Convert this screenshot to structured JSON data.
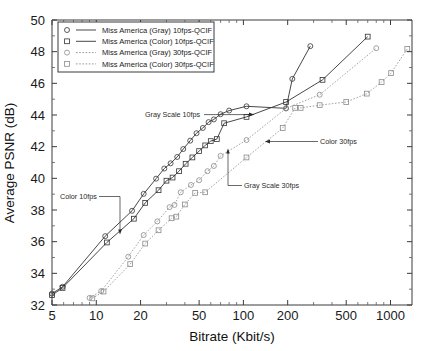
{
  "chart_data": {
    "type": "line",
    "title": "",
    "xlabel": "Bitrate (Kbit/s)",
    "ylabel": "Average PSNR (dB)",
    "xscale": "log",
    "yscale": "linear",
    "xlim": [
      5,
      1400
    ],
    "ylim": [
      32,
      50
    ],
    "xticks": [
      5,
      10,
      20,
      50,
      100,
      200,
      500,
      1000
    ],
    "xticklabels": [
      "5",
      "10",
      "20",
      "50",
      "100",
      "200",
      "500",
      "1000"
    ],
    "yticks": [
      32,
      34,
      36,
      38,
      40,
      42,
      44,
      46,
      48,
      50
    ],
    "yticklabels": [
      "32",
      "34",
      "36",
      "38",
      "40",
      "42",
      "44",
      "46",
      "48",
      "50"
    ],
    "grid": false,
    "legend_position": "upper-left",
    "series": [
      {
        "name": "Miss America (Gray) 10fps-QCIF",
        "marker": "circle",
        "linestyle": "solid",
        "color": "#333333",
        "points": [
          [
            5.0,
            32.72
          ],
          [
            5.9,
            33.15
          ],
          [
            11.5,
            36.35
          ],
          [
            17.5,
            37.95
          ],
          [
            21.0,
            39.02
          ],
          [
            25.5,
            39.98
          ],
          [
            29.0,
            40.62
          ],
          [
            32.0,
            40.95
          ],
          [
            35.5,
            41.35
          ],
          [
            39.0,
            41.85
          ],
          [
            43.5,
            42.38
          ],
          [
            48.0,
            42.85
          ],
          [
            53.0,
            43.18
          ],
          [
            58.0,
            43.55
          ],
          [
            63.0,
            43.72
          ],
          [
            70.0,
            44.05
          ],
          [
            80.0,
            44.28
          ],
          [
            105.0,
            44.55
          ],
          [
            195.0,
            44.42
          ],
          [
            215.0,
            46.28
          ],
          [
            285.0,
            48.35
          ]
        ]
      },
      {
        "name": "Miss America (Color) 10fps-QCIF",
        "marker": "square",
        "linestyle": "solid",
        "color": "#333333",
        "points": [
          [
            5.0,
            32.62
          ],
          [
            5.9,
            33.08
          ],
          [
            11.8,
            35.95
          ],
          [
            18.0,
            37.45
          ],
          [
            21.5,
            38.45
          ],
          [
            26.5,
            39.25
          ],
          [
            30.0,
            39.85
          ],
          [
            33.0,
            40.05
          ],
          [
            36.5,
            40.45
          ],
          [
            40.5,
            40.92
          ],
          [
            45.0,
            41.32
          ],
          [
            50.0,
            41.72
          ],
          [
            55.0,
            42.08
          ],
          [
            60.0,
            42.35
          ],
          [
            66.0,
            42.48
          ],
          [
            74.0,
            43.48
          ],
          [
            105.0,
            43.88
          ],
          [
            195.0,
            44.82
          ],
          [
            345.0,
            46.22
          ],
          [
            700.0,
            48.95
          ]
        ]
      },
      {
        "name": "Miss America (Gray) 30fps-QCIF",
        "marker": "circle",
        "linestyle": "dotted",
        "color": "#8a8a8a",
        "points": [
          [
            9.0,
            32.45
          ],
          [
            10.8,
            32.88
          ],
          [
            16.5,
            35.05
          ],
          [
            21.0,
            36.42
          ],
          [
            26.0,
            37.28
          ],
          [
            31.5,
            38.18
          ],
          [
            34.0,
            38.32
          ],
          [
            37.5,
            39.12
          ],
          [
            44.0,
            39.58
          ],
          [
            50.0,
            39.88
          ],
          [
            57.0,
            40.45
          ],
          [
            63.0,
            40.78
          ],
          [
            70.0,
            41.42
          ],
          [
            105.0,
            42.42
          ],
          [
            195.0,
            44.42
          ],
          [
            330.0,
            45.28
          ],
          [
            800.0,
            48.22
          ]
        ]
      },
      {
        "name": "Miss America (Color) 30fps-QCIF",
        "marker": "square",
        "linestyle": "dotted",
        "color": "#8a8a8a",
        "points": [
          [
            9.4,
            32.42
          ],
          [
            11.2,
            32.85
          ],
          [
            17.0,
            34.58
          ],
          [
            21.5,
            35.88
          ],
          [
            26.5,
            36.72
          ],
          [
            32.5,
            37.48
          ],
          [
            35.0,
            37.58
          ],
          [
            40.0,
            38.35
          ],
          [
            47.0,
            39.08
          ],
          [
            55.0,
            39.12
          ],
          [
            105.0,
            41.32
          ],
          [
            185.0,
            43.18
          ],
          [
            225.0,
            44.45
          ],
          [
            245.0,
            44.45
          ],
          [
            330.0,
            44.62
          ],
          [
            500.0,
            44.82
          ],
          [
            690.0,
            45.35
          ],
          [
            870.0,
            46.08
          ],
          [
            1010.0,
            46.65
          ],
          [
            1300.0,
            48.18
          ]
        ]
      }
    ],
    "annotations": [
      {
        "id": "gray-scale-10fps",
        "text": "Gray Scale 10fps",
        "text_x": 145,
        "text_y": 117,
        "anchor": "start",
        "leader": "M 204,114.6 L 254,114.6",
        "arrow": "M 254,114.6 L 249,112.6 L 249,116.6 Z"
      },
      {
        "id": "color-10fps",
        "text": "Color 10fps",
        "text_x": 60,
        "text_y": 199,
        "anchor": "start",
        "leader": "M 99,196.5 L 120,196.5 L 120,232 L 121.5,229",
        "arrow": "M 120,234.5 L 118.2,229.5 L 121.8,229.5 Z"
      },
      {
        "id": "color-30fps",
        "text": "Color 30fps",
        "text_x": 320,
        "text_y": 144,
        "anchor": "start",
        "leader": "M 318,141.5 L 268,141.5",
        "arrow": "M 265,141.5 L 270,139.5 L 270,143.5 Z"
      },
      {
        "id": "gray-scale-30fps",
        "text": "Gray Scale 30fps",
        "text_x": 244,
        "text_y": 188,
        "anchor": "start",
        "leader": "M 242,185.5 L 228,185.5 L 228,154 L 228,152",
        "arrow": "M 228,148.5 L 226.2,153.5 L 229.8,153.5 Z"
      }
    ],
    "legend_entries": [
      {
        "label": "Miss America (Gray) 10fps-QCIF",
        "marker": "circle",
        "linestyle": "solid",
        "color": "#333333"
      },
      {
        "label": "Miss America (Color) 10fps-QCIF",
        "marker": "square",
        "linestyle": "solid",
        "color": "#333333"
      },
      {
        "label": "Miss America (Gray) 30fps-QCIF",
        "marker": "circle",
        "linestyle": "dotted",
        "color": "#8a8a8a"
      },
      {
        "label": "Miss America (Color) 30fps-QCIF",
        "marker": "square",
        "linestyle": "dotted",
        "color": "#8a8a8a"
      }
    ]
  },
  "plot_geometry": {
    "left": 52,
    "right": 412,
    "top": 20,
    "bottom": 305
  },
  "legend_geometry": {
    "x": 58,
    "y": 22,
    "width": 156,
    "height": 50
  }
}
